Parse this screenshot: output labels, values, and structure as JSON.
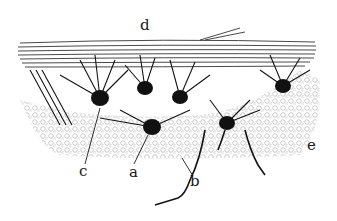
{
  "figure": {
    "type": "neuron-layer illustration",
    "ink_color": "#141414",
    "background": "#ffffff",
    "granule_color": "#9a9a9a"
  },
  "labels": [
    {
      "id": "d",
      "text": "d",
      "x": 140,
      "y": 18
    },
    {
      "id": "c",
      "text": "c",
      "x": 79,
      "y": 164
    },
    {
      "id": "a",
      "text": "a",
      "x": 129,
      "y": 165
    },
    {
      "id": "b",
      "text": "b",
      "x": 190,
      "y": 174
    },
    {
      "id": "e",
      "text": "e",
      "x": 307,
      "y": 138
    }
  ],
  "cells": [
    {
      "x": 100,
      "y": 98,
      "r": 8
    },
    {
      "x": 145,
      "y": 88,
      "r": 7
    },
    {
      "x": 180,
      "y": 97,
      "r": 7
    },
    {
      "x": 152,
      "y": 127,
      "r": 8
    },
    {
      "x": 227,
      "y": 123,
      "r": 7
    },
    {
      "x": 283,
      "y": 86,
      "r": 7
    }
  ]
}
